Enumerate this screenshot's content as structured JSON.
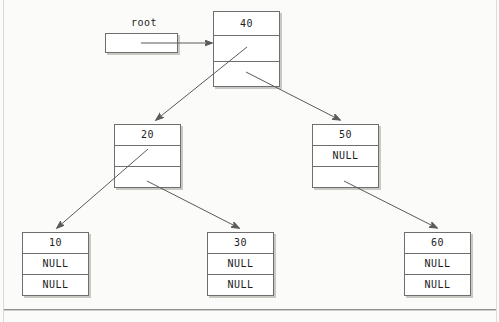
{
  "diagram": {
    "pointer": {
      "label": "root",
      "box_value": ""
    },
    "null_text": "NULL",
    "nodes": [
      {
        "id": "node-40",
        "value": "40",
        "left": "",
        "right": "",
        "left_is_null": false,
        "right_is_null": false
      },
      {
        "id": "node-20",
        "value": "20",
        "left": "",
        "right": "",
        "left_is_null": false,
        "right_is_null": false
      },
      {
        "id": "node-50",
        "value": "50",
        "left": "NULL",
        "right": "",
        "left_is_null": true,
        "right_is_null": false
      },
      {
        "id": "node-10",
        "value": "10",
        "left": "NULL",
        "right": "NULL",
        "left_is_null": true,
        "right_is_null": true
      },
      {
        "id": "node-30",
        "value": "30",
        "left": "NULL",
        "right": "NULL",
        "left_is_null": true,
        "right_is_null": true
      },
      {
        "id": "node-60",
        "value": "60",
        "left": "NULL",
        "right": "NULL",
        "left_is_null": true,
        "right_is_null": true
      }
    ],
    "edges": [
      {
        "from": "root-pointer",
        "to": "node-40"
      },
      {
        "from": "node-40",
        "to": "node-20"
      },
      {
        "from": "node-40",
        "to": "node-50"
      },
      {
        "from": "node-20",
        "to": "node-10"
      },
      {
        "from": "node-20",
        "to": "node-30"
      },
      {
        "from": "node-50",
        "to": "node-60"
      }
    ],
    "colors": {
      "background": "#fbfbf9",
      "box_border": "#6e6e6e",
      "box_fill": "#ffffff",
      "box_shadow": "#c9c9c4",
      "link": "#5a5a5a",
      "text": "#1d1d1d"
    }
  }
}
